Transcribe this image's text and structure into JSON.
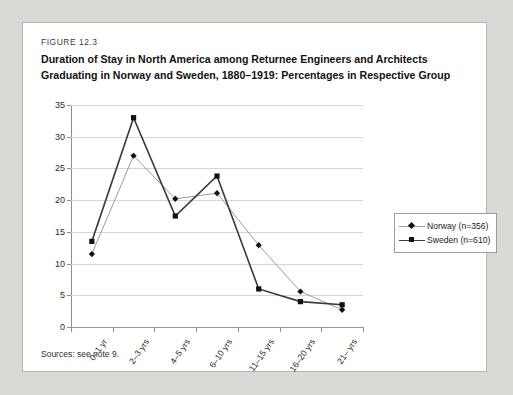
{
  "figure": {
    "number": "FIGURE 12.3",
    "title": "Duration of Stay in North America among Returnee Engineers and Architects Graduating in Norway and Sweden, 1880–1919: Percentages in Respective Group",
    "sources": "Sources: see note 9."
  },
  "chart_data": {
    "type": "line",
    "title": "Duration of Stay in North America among Returnee Engineers and Architects Graduating in Norway and Sweden, 1880–1919: Percentages in Respective Group",
    "xlabel": "",
    "ylabel": "",
    "categories": [
      "0–1 yr",
      "2–3 yrs",
      "4–5 yrs",
      "6–10 yrs",
      "11–15 yrs",
      "16–20 yrs",
      "21– yrs"
    ],
    "series": [
      {
        "name": "Norway (n=356)",
        "marker": "diamond",
        "color": "#9a9a9a",
        "marker_color": "#111111",
        "values": [
          11.5,
          27.0,
          20.2,
          21.1,
          12.9,
          5.6,
          2.7
        ]
      },
      {
        "name": "Sweden (n=610)",
        "marker": "square",
        "color": "#3a3a3a",
        "marker_color": "#111111",
        "values": [
          13.5,
          33.0,
          17.5,
          23.8,
          6.0,
          4.0,
          3.5
        ]
      }
    ],
    "ylim": [
      0,
      35
    ],
    "yticks": [
      0,
      5,
      10,
      15,
      20,
      25,
      30,
      35
    ],
    "grid": true,
    "legend_position": "right"
  }
}
